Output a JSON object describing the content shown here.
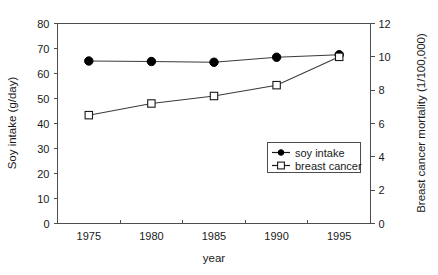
{
  "chart_data": {
    "type": "line",
    "title": "",
    "xlabel": "year",
    "x": [
      1975,
      1980,
      1985,
      1990,
      1995
    ],
    "xtick_labels": [
      "1975",
      "1980",
      "1985",
      "1990",
      "1995"
    ],
    "xlim": [
      1972.5,
      1997.5
    ],
    "grid": false,
    "legend_position": "bottom-right",
    "axes": {
      "left": {
        "label": "Soy intake (g/day)",
        "ylim": [
          0,
          80
        ],
        "ticks": [
          0,
          10,
          20,
          30,
          40,
          50,
          60,
          70,
          80
        ],
        "tick_labels": [
          "0",
          "10",
          "20",
          "30",
          "40",
          "50",
          "60",
          "70",
          "80"
        ]
      },
      "right": {
        "label": "Breast cancer mortality (1/100,000)",
        "ylim": [
          0,
          12
        ],
        "ticks": [
          0,
          2,
          4,
          6,
          8,
          10,
          12
        ],
        "tick_labels": [
          "0",
          "2",
          "4",
          "6",
          "8",
          "10",
          "12"
        ]
      }
    },
    "series": [
      {
        "name": "soy intake",
        "axis": "left",
        "marker": "filled-circle",
        "color": "#000000",
        "values": [
          65.0,
          64.8,
          64.5,
          66.5,
          67.5
        ]
      },
      {
        "name": "breast cancer",
        "axis": "right",
        "marker": "open-square",
        "color": "#1a1a1a",
        "values": [
          6.5,
          7.2,
          7.65,
          8.3,
          10.0
        ]
      }
    ],
    "legend": [
      {
        "label": "soy intake",
        "marker": "filled-circle"
      },
      {
        "label": "breast cancer",
        "marker": "open-square"
      }
    ]
  }
}
